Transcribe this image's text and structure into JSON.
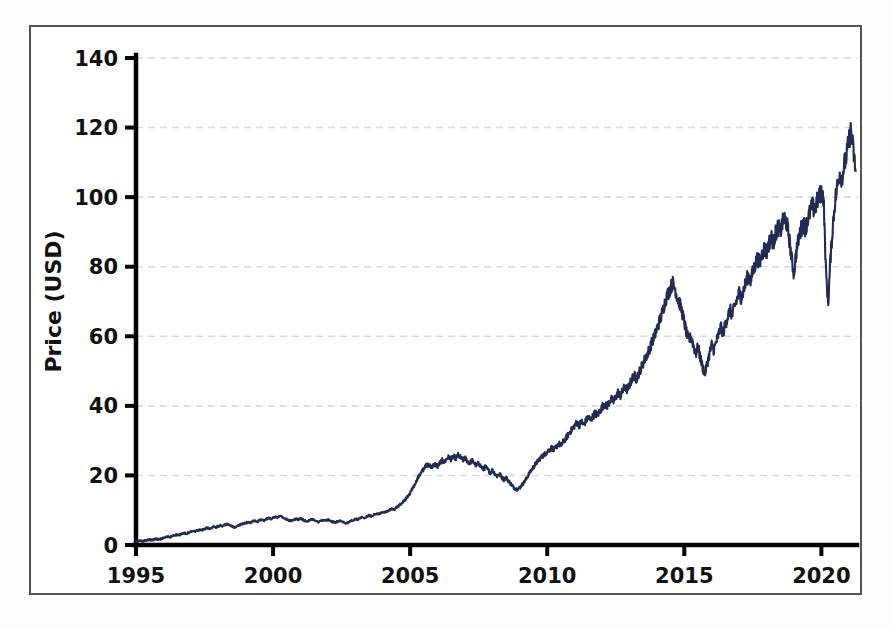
{
  "figure": {
    "background_color": "#ffffff",
    "frame_color": "#535353",
    "series_color": "#232b52",
    "grid_color": "#d2dce6"
  },
  "chart_data": {
    "type": "line",
    "title": "",
    "subtitle": "",
    "xlabel": "",
    "ylabel": "Price (USD)",
    "xlim": [
      1995,
      2021.3
    ],
    "ylim": [
      0,
      140
    ],
    "xticks": [
      1995,
      2000,
      2005,
      2010,
      2015,
      2020
    ],
    "xtick_labels": [
      "1995",
      "2000",
      "2005",
      "2010",
      "2015",
      "2020"
    ],
    "yticks": [
      0,
      20,
      40,
      60,
      80,
      100,
      120,
      140
    ],
    "ytick_labels": [
      "0",
      "20",
      "40",
      "60",
      "80",
      "100",
      "120",
      "140"
    ],
    "grid": true,
    "grid_axis": "y",
    "grid_style": "dashed",
    "legend": null,
    "legend_position": "none",
    "annotations": [],
    "series": [
      {
        "name": "Price (USD)",
        "color": "#232b52",
        "line_width": 2.1,
        "x": [
          1995.0,
          1995.08,
          1995.17,
          1995.25,
          1995.33,
          1995.42,
          1995.5,
          1995.58,
          1995.67,
          1995.75,
          1995.83,
          1995.92,
          1996.0,
          1996.08,
          1996.17,
          1996.25,
          1996.33,
          1996.42,
          1996.5,
          1996.58,
          1996.67,
          1996.75,
          1996.83,
          1996.92,
          1997.0,
          1997.08,
          1997.17,
          1997.25,
          1997.33,
          1997.42,
          1997.5,
          1997.58,
          1997.67,
          1997.75,
          1997.83,
          1997.92,
          1998.0,
          1998.08,
          1998.17,
          1998.25,
          1998.33,
          1998.42,
          1998.5,
          1998.58,
          1998.67,
          1998.75,
          1998.83,
          1998.92,
          1999.0,
          1999.08,
          1999.17,
          1999.25,
          1999.33,
          1999.42,
          1999.5,
          1999.58,
          1999.67,
          1999.75,
          1999.83,
          1999.92,
          2000.0,
          2000.08,
          2000.17,
          2000.25,
          2000.33,
          2000.42,
          2000.5,
          2000.58,
          2000.67,
          2000.75,
          2000.83,
          2000.92,
          2001.0,
          2001.08,
          2001.17,
          2001.25,
          2001.33,
          2001.42,
          2001.5,
          2001.58,
          2001.67,
          2001.75,
          2001.83,
          2001.92,
          2002.0,
          2002.08,
          2002.17,
          2002.25,
          2002.33,
          2002.42,
          2002.5,
          2002.58,
          2002.67,
          2002.75,
          2002.83,
          2002.92,
          2003.0,
          2003.08,
          2003.17,
          2003.25,
          2003.33,
          2003.42,
          2003.5,
          2003.58,
          2003.67,
          2003.75,
          2003.83,
          2003.92,
          2004.0,
          2004.08,
          2004.17,
          2004.25,
          2004.33,
          2004.42,
          2004.5,
          2004.58,
          2004.67,
          2004.75,
          2004.83,
          2004.92,
          2005.0,
          2005.08,
          2005.17,
          2005.25,
          2005.33,
          2005.42,
          2005.5,
          2005.58,
          2005.67,
          2005.75,
          2005.83,
          2005.92,
          2006.0,
          2006.08,
          2006.17,
          2006.25,
          2006.33,
          2006.42,
          2006.5,
          2006.58,
          2006.67,
          2006.75,
          2006.83,
          2006.92,
          2007.0,
          2007.08,
          2007.17,
          2007.25,
          2007.33,
          2007.42,
          2007.5,
          2007.58,
          2007.67,
          2007.75,
          2007.83,
          2007.92,
          2008.0,
          2008.08,
          2008.17,
          2008.25,
          2008.33,
          2008.42,
          2008.5,
          2008.58,
          2008.67,
          2008.75,
          2008.83,
          2008.92,
          2009.0,
          2009.08,
          2009.17,
          2009.25,
          2009.33,
          2009.42,
          2009.5,
          2009.58,
          2009.67,
          2009.75,
          2009.83,
          2009.92,
          2010.0,
          2010.08,
          2010.17,
          2010.25,
          2010.33,
          2010.42,
          2010.5,
          2010.58,
          2010.67,
          2010.75,
          2010.83,
          2010.92,
          2011.0,
          2011.08,
          2011.17,
          2011.25,
          2011.33,
          2011.42,
          2011.5,
          2011.58,
          2011.67,
          2011.75,
          2011.83,
          2011.92,
          2012.0,
          2012.08,
          2012.17,
          2012.25,
          2012.33,
          2012.42,
          2012.5,
          2012.58,
          2012.67,
          2012.75,
          2012.83,
          2012.92,
          2013.0,
          2013.08,
          2013.17,
          2013.25,
          2013.33,
          2013.42,
          2013.5,
          2013.58,
          2013.67,
          2013.75,
          2013.83,
          2013.92,
          2014.0,
          2014.08,
          2014.17,
          2014.25,
          2014.33,
          2014.42,
          2014.5,
          2014.58,
          2014.67,
          2014.75,
          2014.83,
          2014.92,
          2015.0,
          2015.08,
          2015.17,
          2015.25,
          2015.33,
          2015.42,
          2015.5,
          2015.58,
          2015.67,
          2015.75,
          2015.83,
          2015.92,
          2016.0,
          2016.08,
          2016.17,
          2016.25,
          2016.33,
          2016.42,
          2016.5,
          2016.58,
          2016.67,
          2016.75,
          2016.83,
          2016.92,
          2017.0,
          2017.08,
          2017.17,
          2017.25,
          2017.33,
          2017.42,
          2017.5,
          2017.58,
          2017.67,
          2017.75,
          2017.83,
          2017.92,
          2018.0,
          2018.08,
          2018.17,
          2018.25,
          2018.33,
          2018.42,
          2018.5,
          2018.58,
          2018.67,
          2018.75,
          2018.83,
          2018.92,
          2019.0,
          2019.08,
          2019.17,
          2019.25,
          2019.33,
          2019.42,
          2019.5,
          2019.58,
          2019.67,
          2019.75,
          2019.83,
          2019.92,
          2020.0,
          2020.08,
          2020.17,
          2020.25,
          2020.33,
          2020.42,
          2020.5,
          2020.58,
          2020.67,
          2020.75,
          2020.83,
          2020.92,
          2021.0,
          2021.08,
          2021.17,
          2021.25
        ],
        "y": [
          1.0,
          1.1,
          1.2,
          1.1,
          1.3,
          1.4,
          1.5,
          1.4,
          1.6,
          1.7,
          1.6,
          1.8,
          2.0,
          2.2,
          2.4,
          2.3,
          2.6,
          2.8,
          3.0,
          2.9,
          3.2,
          3.4,
          3.3,
          3.5,
          3.8,
          4.0,
          3.9,
          4.2,
          4.4,
          4.3,
          4.6,
          4.9,
          4.7,
          5.0,
          5.3,
          5.1,
          5.4,
          5.6,
          5.5,
          5.8,
          6.0,
          5.7,
          5.4,
          5.1,
          5.3,
          5.6,
          5.9,
          6.1,
          6.3,
          6.6,
          6.4,
          6.8,
          7.0,
          6.7,
          7.1,
          7.3,
          7.0,
          7.4,
          7.7,
          7.5,
          7.8,
          8.1,
          7.9,
          8.3,
          8.0,
          7.7,
          7.4,
          7.1,
          6.9,
          7.2,
          7.5,
          7.3,
          7.6,
          7.3,
          7.0,
          6.8,
          7.1,
          7.4,
          7.2,
          6.9,
          6.6,
          6.9,
          7.2,
          7.0,
          7.3,
          7.0,
          6.7,
          6.4,
          6.7,
          7.0,
          6.8,
          6.5,
          6.2,
          6.5,
          6.9,
          7.2,
          7.5,
          7.3,
          7.7,
          8.0,
          7.8,
          8.2,
          8.5,
          8.3,
          8.7,
          9.0,
          8.8,
          9.2,
          9.5,
          9.3,
          9.7,
          10.0,
          10.4,
          10.2,
          10.8,
          11.3,
          11.8,
          12.4,
          13.2,
          14.0,
          15.0,
          16.2,
          17.5,
          18.8,
          20.0,
          21.0,
          22.0,
          22.8,
          23.0,
          22.5,
          22.8,
          23.2,
          22.6,
          23.5,
          24.3,
          23.8,
          24.8,
          25.3,
          24.6,
          25.5,
          24.9,
          25.8,
          25.2,
          24.4,
          25.0,
          24.2,
          23.5,
          24.3,
          23.6,
          22.8,
          23.5,
          22.6,
          21.8,
          22.5,
          21.6,
          20.8,
          21.5,
          20.6,
          19.8,
          20.5,
          19.6,
          18.8,
          19.4,
          18.5,
          17.6,
          16.8,
          16.2,
          16.0,
          16.5,
          17.3,
          18.2,
          19.2,
          20.4,
          21.5,
          22.4,
          23.3,
          24.2,
          25.0,
          25.6,
          26.2,
          26.8,
          27.4,
          28.0,
          27.2,
          28.2,
          29.2,
          28.5,
          29.6,
          30.5,
          31.5,
          32.5,
          33.4,
          34.3,
          35.2,
          34.4,
          35.5,
          34.6,
          35.8,
          36.8,
          35.9,
          37.0,
          38.0,
          37.2,
          38.5,
          39.6,
          40.6,
          39.7,
          40.9,
          42.0,
          41.2,
          42.5,
          43.8,
          42.9,
          44.2,
          45.5,
          44.6,
          46.0,
          47.5,
          48.8,
          47.8,
          49.2,
          50.8,
          52.3,
          53.8,
          55.2,
          56.8,
          58.5,
          60.2,
          62.0,
          64.0,
          66.0,
          68.5,
          70.8,
          72.5,
          74.0,
          75.3,
          73.5,
          71.0,
          69.5,
          67.0,
          64.0,
          61.0,
          58.5,
          60.0,
          57.5,
          55.0,
          57.0,
          54.0,
          51.0,
          49.2,
          52.0,
          55.0,
          57.5,
          56.0,
          58.5,
          60.5,
          62.5,
          61.0,
          63.5,
          65.5,
          67.5,
          66.0,
          68.5,
          70.5,
          72.5,
          71.0,
          73.5,
          75.5,
          77.5,
          76.0,
          78.5,
          80.5,
          82.5,
          81.0,
          83.5,
          85.5,
          84.0,
          86.5,
          88.5,
          87.0,
          89.5,
          91.5,
          90.0,
          92.5,
          94.0,
          92.0,
          88.0,
          82.0,
          78.0,
          84.0,
          88.0,
          90.5,
          92.5,
          91.0,
          93.5,
          95.5,
          97.5,
          96.0,
          98.5,
          100.0,
          101.5,
          100.0,
          78.0,
          69.5,
          82.0,
          92.0,
          99.0,
          103.0,
          107.0,
          105.5,
          109.0,
          112.0,
          116.0,
          119.5,
          113.0,
          107.5
        ]
      }
    ]
  },
  "axes": {
    "y_title": "Price (USD)",
    "x_tick_labels": [
      "1995",
      "2000",
      "2005",
      "2010",
      "2015",
      "2020"
    ],
    "y_tick_labels": [
      "0",
      "20",
      "40",
      "60",
      "80",
      "100",
      "120",
      "140"
    ]
  }
}
